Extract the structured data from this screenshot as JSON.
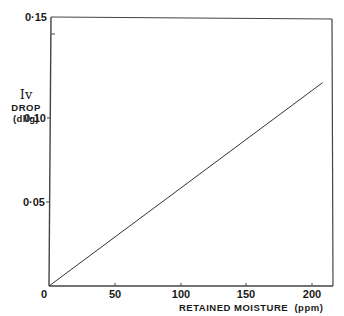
{
  "chart_data": {
    "type": "line",
    "title": "",
    "xlabel": "RETAINED MOISTURE (ppm)",
    "ylabel": [
      "Iv",
      "DROP",
      "(dl/g)"
    ],
    "xlim": [
      0,
      210
    ],
    "ylim": [
      0,
      0.15
    ],
    "x_ticks": [
      "0",
      "50",
      "100",
      "150",
      "200"
    ],
    "y_ticks": [
      "0.05",
      "0.10",
      "0.15"
    ],
    "origin_label": "0",
    "grid": false,
    "legend": null,
    "series": [
      {
        "name": "Iv drop vs retained moisture",
        "x": [
          0,
          208
        ],
        "y": [
          0,
          0.121
        ]
      }
    ]
  },
  "labels": {
    "y_title_1": "Iv",
    "y_title_2": "DROP",
    "y_title_3": "(dl/g)",
    "x_title": "RETAINED MOISTURE  (ppm)",
    "origin": "0",
    "x50": "50",
    "x100": "100",
    "x150": "150",
    "x200": "200",
    "y005": "0·05",
    "y010": "0·10",
    "y015": "0·15"
  }
}
